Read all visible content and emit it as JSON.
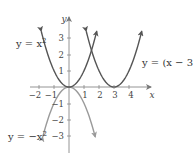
{
  "chart_data": {
    "type": "line",
    "title": "",
    "xlabel": "x",
    "ylabel": "y",
    "xlim": [
      -2.5,
      5.4
    ],
    "ylim": [
      -4.2,
      4.3
    ],
    "x_ticks": [
      -2,
      -1,
      1,
      2,
      3,
      4
    ],
    "y_ticks": [
      -3,
      -2,
      -1,
      1,
      2,
      3
    ],
    "grid": false,
    "series": [
      {
        "name": "y = x^2",
        "label": "y = x²",
        "formula": "x^2",
        "color": "#555555",
        "x_range": [
          -1.85,
          1.85
        ]
      },
      {
        "name": "y = (x - 3)^2",
        "label": "y = (x − 3)²",
        "formula": "(x-3)^2",
        "color": "#555555",
        "x_range": [
          1.15,
          4.85
        ]
      },
      {
        "name": "y = -x^2",
        "label": "y = −x²",
        "formula": "-x^2",
        "color": "#9a9a9a",
        "x_range": [
          -1.75,
          1.75
        ]
      }
    ]
  },
  "labels": {
    "y_axis": "y",
    "x_axis": "x",
    "curve_x2": "y = x",
    "curve_x2_sup": "2",
    "curve_shift": "y = (x − 3)",
    "curve_shift_sup": "2",
    "curve_neg": "y = −x",
    "curve_neg_sup": "2"
  },
  "ticks": {
    "xm2": "−2",
    "xm1": "−1",
    "x1": "1",
    "x2": "2",
    "x3": "3",
    "x4": "4",
    "y1": "1",
    "y2": "2",
    "y3": "3",
    "ym1": "−1",
    "ym2": "−2",
    "ym3": "−3"
  }
}
